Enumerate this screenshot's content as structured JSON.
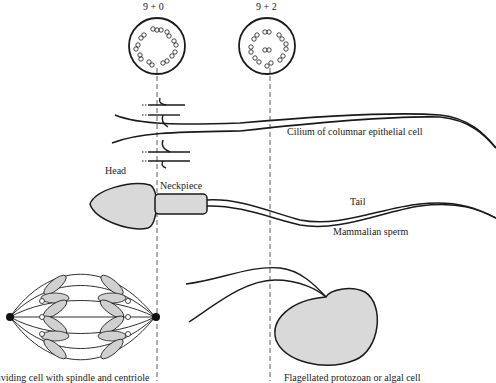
{
  "diagram": {
    "axoneme_labels": {
      "left": "9 + 0",
      "right": "9 + 2"
    },
    "labels": {
      "cilium": "Cilium of columnar epithelial cell",
      "head": "Head",
      "neckpiece": "Neckpiece",
      "tail": "Tail",
      "sperm": "Mammalian sperm",
      "dividing_cell": "ividing cell with spindle and centriole",
      "flagellated": "Flagellated protozoan or algal cell"
    },
    "colors": {
      "line": "#1a1a1a",
      "fill": "#d9d9d9",
      "background": "#ffffff"
    }
  }
}
